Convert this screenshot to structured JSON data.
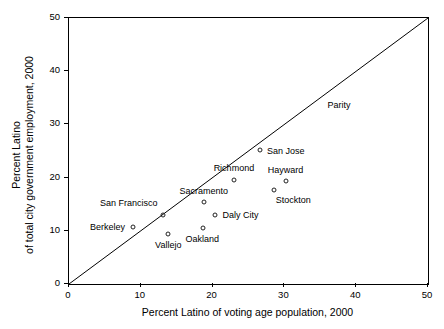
{
  "chart_data": {
    "type": "scatter",
    "title": "",
    "xlabel": "Percent Latino of voting age population, 2000",
    "ylabel_line1": "Percent Latino",
    "ylabel_line2": "of total city government employment, 2000",
    "xlim": [
      0,
      50
    ],
    "ylim": [
      0,
      50
    ],
    "xticks": [
      0,
      10,
      20,
      30,
      40,
      50
    ],
    "yticks": [
      0,
      10,
      20,
      30,
      40,
      50
    ],
    "xtick_labels": [
      "0",
      "10",
      "20",
      "30",
      "40",
      "50"
    ],
    "ytick_labels": [
      "0",
      "10",
      "20",
      "30",
      "40",
      "50"
    ],
    "grid": false,
    "legend": "none",
    "reference_line": {
      "name": "Parity",
      "label": "Parity",
      "from": [
        0,
        0
      ],
      "to": [
        50,
        50
      ],
      "label_x": 36.0,
      "label_y": 33.5
    },
    "points": [
      {
        "name": "San Jose",
        "x": 26.6,
        "y": 25.1,
        "label": "San Jose",
        "label_dx": 7,
        "label_dy": 1
      },
      {
        "name": "Richmond",
        "x": 23.0,
        "y": 19.6,
        "label": "Richmond",
        "label_dx": 0,
        "label_dy": -11
      },
      {
        "name": "Hayward",
        "x": 30.2,
        "y": 19.3,
        "label": "Hayward",
        "label_dx": 0,
        "label_dy": -11
      },
      {
        "name": "Stockton",
        "x": 28.5,
        "y": 17.6,
        "label": "Stockton",
        "label_dx": 2,
        "label_dy": 10
      },
      {
        "name": "Sacramento",
        "x": 18.8,
        "y": 15.4,
        "label": "Sacramento",
        "label_dx": 0,
        "label_dy": -11
      },
      {
        "name": "San Francisco",
        "x": 13.1,
        "y": 13.0,
        "label": "San Francisco",
        "label_dx": -5,
        "label_dy": -11
      },
      {
        "name": "Daly City",
        "x": 20.4,
        "y": 13.0,
        "label": "Daly City",
        "label_dx": 7,
        "label_dy": 1
      },
      {
        "name": "Berkeley",
        "x": 8.9,
        "y": 10.7,
        "label": "Berkeley",
        "label_dx": -8,
        "label_dy": 0
      },
      {
        "name": "Oakland",
        "x": 18.6,
        "y": 10.5,
        "label": "Oakland",
        "label_dx": 0,
        "label_dy": 11
      },
      {
        "name": "Vallejo",
        "x": 13.8,
        "y": 9.4,
        "label": "Vallejo",
        "label_dx": 0,
        "label_dy": 12
      }
    ],
    "colors": {
      "axis": "#000000",
      "marker_stroke": "#222222",
      "reference_line": "#000000",
      "background": "#ffffff",
      "text": "#000000"
    }
  }
}
